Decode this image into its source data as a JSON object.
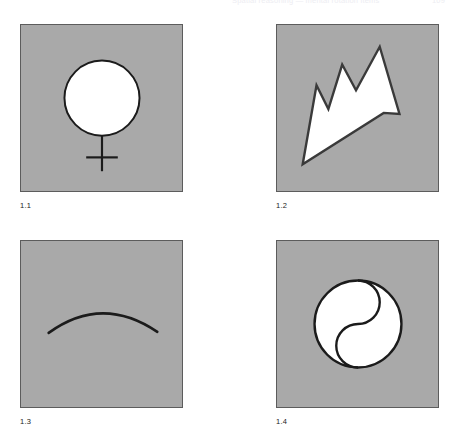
{
  "page": {
    "header_title": "Spatial reasoning — mental rotation items",
    "folio": "109",
    "background_color": "#ffffff"
  },
  "plate": {
    "panel_fill": "#a9a9a9",
    "panel_border_color": "#5c5c5c",
    "ink_color": "#1b1b1b",
    "figure_fill": "#ffffff",
    "figures": [
      {
        "caption": "1.1",
        "icon": "venus-symbol-icon",
        "description": "White outlined circle with a vertical stem and horizontal cross bar below it (female / Venus sign)",
        "geometry": {
          "circle_center": [
            82,
            74
          ],
          "circle_radius": 38,
          "stem_x": 82,
          "stem_top": 112,
          "stem_bottom": 148,
          "crossbar_y": 134,
          "crossbar_left": 66,
          "crossbar_right": 98
        }
      },
      {
        "caption": "1.2",
        "icon": "jagged-arrow-icon",
        "description": "Tapered sawtooth arrow / lightning wedge, white fill with dark outline, narrow tip at lower left and three peaks along the upper right",
        "geometry": {
          "points": "26,141 40,61 52,85 66,40 80,66 104,22 124,90 108,89"
        }
      },
      {
        "caption": "1.3",
        "icon": "shallow-arc-icon",
        "description": "Single shallow arc, convex upward, drawn as a thick black stroke across the middle of the panel",
        "geometry": {
          "path": "M28,93 Q82,54 138,92",
          "stroke_width": 2.6
        }
      },
      {
        "caption": "1.4",
        "icon": "yin-yang-circle-icon",
        "description": "White outlined circle split by an S-shaped divider curve, as in a yin-yang emblem",
        "geometry": {
          "circle_center": [
            82,
            84
          ],
          "circle_radius": 44,
          "divider_path": "M82,40 A22,22 0 0 1 82,84 A22,22 0 0 0 82,128"
        }
      }
    ]
  }
}
